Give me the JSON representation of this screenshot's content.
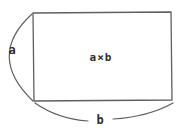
{
  "diagram": {
    "area_label": "a×b",
    "height_label": "a",
    "width_label": "b"
  },
  "colors": {
    "stroke": "#5f5f5f",
    "text": "#2e2e2e",
    "background": "#ffffff"
  }
}
